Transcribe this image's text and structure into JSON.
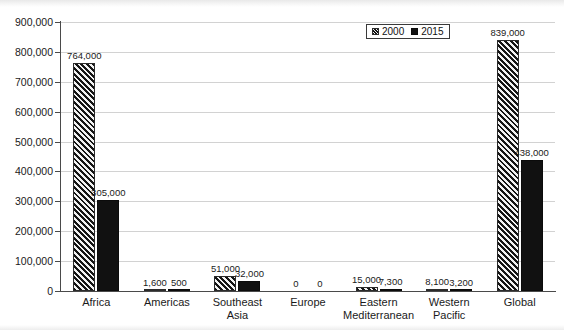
{
  "chart_data": {
    "type": "bar",
    "title": "",
    "subtitle": "",
    "xlabel": "",
    "ylabel": "",
    "ylim": [
      0,
      900000
    ],
    "ytick_labels": [
      "900,000",
      "800,000",
      "700,000",
      "600,000",
      "500,000",
      "400,000",
      "300,000",
      "200,000",
      "100,000",
      "0"
    ],
    "ytick_values": [
      900000,
      800000,
      700000,
      600000,
      500000,
      400000,
      300000,
      200000,
      100000,
      0
    ],
    "grid": true,
    "legend_position": "top-right",
    "categories": [
      "Africa",
      "Americas",
      "Southeast Asia",
      "Europe",
      "Eastern Mediterranean",
      "Western Pacific",
      "Global"
    ],
    "category_lines": [
      [
        "Africa"
      ],
      [
        "Americas"
      ],
      [
        "Southeast",
        "Asia"
      ],
      [
        "Europe"
      ],
      [
        "Eastern",
        "Mediterranean"
      ],
      [
        "Western",
        "Pacific"
      ],
      [
        "Global"
      ]
    ],
    "series": [
      {
        "name": "2000",
        "fill": "diagonal-hatch",
        "color": "#2b2b2b",
        "values": [
          764000,
          1600,
          51000,
          0,
          15000,
          8100,
          839000
        ],
        "labels": [
          "764,000",
          "1,600",
          "51,000",
          "0",
          "15,000",
          "8,100",
          "839,000"
        ]
      },
      {
        "name": "2015",
        "fill": "solid",
        "color": "#111111",
        "values": [
          305000,
          500,
          32000,
          0,
          7300,
          3200,
          438000
        ],
        "labels": [
          "305,000",
          "500",
          "32,000",
          "0",
          "7,300",
          "3,200",
          "438,000"
        ]
      }
    ]
  },
  "legend": {
    "items": [
      {
        "label": "2000"
      },
      {
        "label": "2015"
      }
    ]
  }
}
